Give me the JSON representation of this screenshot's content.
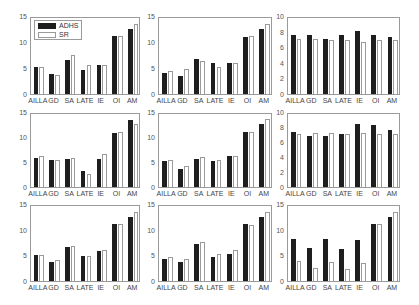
{
  "legend": {
    "items": [
      {
        "label": "ADHS",
        "color": "#1e1e1e"
      },
      {
        "label": "SR",
        "color": "#ffffff"
      }
    ]
  },
  "chart_data": [
    {
      "type": "bar",
      "panel": "row1-col1",
      "categories": [
        "AILLA",
        "GD",
        "SA",
        "LATE",
        "IE",
        "OI",
        "AM"
      ],
      "series": [
        {
          "name": "ADHS",
          "values": [
            5.4,
            4.0,
            6.7,
            4.7,
            5.8,
            11.4,
            12.9
          ]
        },
        {
          "name": "SR",
          "values": [
            5.4,
            3.8,
            7.7,
            5.7,
            5.8,
            11.4,
            13.9
          ]
        }
      ],
      "ylim": [
        0,
        15
      ],
      "yticks": [
        0,
        5,
        10,
        15
      ],
      "legend": true,
      "legend_position": "upper left"
    },
    {
      "type": "bar",
      "panel": "row1-col2",
      "categories": [
        "AILLA",
        "GD",
        "SA",
        "LATE",
        "IE",
        "OI",
        "AM"
      ],
      "series": [
        {
          "name": "ADHS",
          "values": [
            4.2,
            3.6,
            7.0,
            6.2,
            6.2,
            11.3,
            12.9
          ]
        },
        {
          "name": "SR",
          "values": [
            4.6,
            4.9,
            6.5,
            5.3,
            6.2,
            11.4,
            13.9
          ]
        }
      ],
      "ylim": [
        0,
        15
      ],
      "yticks": [
        0,
        5,
        10,
        15
      ]
    },
    {
      "type": "bar",
      "panel": "row1-col3",
      "categories": [
        "AILLA",
        "GD",
        "SA",
        "LATE",
        "IE",
        "OI",
        "AM"
      ],
      "series": [
        {
          "name": "ADHS",
          "values": [
            7.7,
            7.7,
            7.3,
            7.8,
            8.3,
            7.8,
            7.5
          ]
        },
        {
          "name": "SR",
          "values": [
            7.2,
            7.2,
            7.1,
            7.1,
            6.9,
            7.1,
            7.1
          ]
        }
      ],
      "ylim": [
        0,
        10
      ],
      "yticks": [
        0,
        2,
        4,
        6,
        8,
        10
      ]
    },
    {
      "type": "bar",
      "panel": "row2-col1",
      "categories": [
        "AILLA",
        "GD",
        "SA",
        "LATE",
        "IE",
        "OI",
        "AM"
      ],
      "series": [
        {
          "name": "ADHS",
          "values": [
            6.0,
            5.6,
            5.8,
            3.2,
            5.8,
            11.2,
            13.8
          ]
        },
        {
          "name": "SR",
          "values": [
            6.3,
            5.6,
            5.9,
            2.7,
            6.8,
            11.3,
            12.9
          ]
        }
      ],
      "ylim": [
        0,
        15
      ],
      "yticks": [
        0,
        5,
        10,
        15
      ]
    },
    {
      "type": "bar",
      "panel": "row2-col2",
      "categories": [
        "AILLA",
        "GD",
        "SA",
        "LATE",
        "IE",
        "OI",
        "AM"
      ],
      "series": [
        {
          "name": "ADHS",
          "values": [
            5.3,
            3.8,
            5.8,
            5.3,
            6.4,
            11.3,
            12.9
          ]
        },
        {
          "name": "SR",
          "values": [
            5.6,
            4.3,
            6.2,
            5.6,
            6.3,
            11.3,
            13.9
          ]
        }
      ],
      "ylim": [
        0,
        15
      ],
      "yticks": [
        0,
        5,
        10,
        15
      ]
    },
    {
      "type": "bar",
      "panel": "row2-col3",
      "categories": [
        "AILLA",
        "GD",
        "SA",
        "LATE",
        "IE",
        "OI",
        "AM"
      ],
      "series": [
        {
          "name": "ADHS",
          "values": [
            7.6,
            7.0,
            7.0,
            7.2,
            8.6,
            8.5,
            7.8
          ]
        },
        {
          "name": "SR",
          "values": [
            7.3,
            7.4,
            7.4,
            7.3,
            7.4,
            7.3,
            7.3
          ]
        }
      ],
      "ylim": [
        0,
        10
      ],
      "yticks": [
        0,
        2,
        4,
        6,
        8,
        10
      ]
    },
    {
      "type": "bar",
      "panel": "row3-col1",
      "categories": [
        "AILLA",
        "GD",
        "SA",
        "LATE",
        "IE",
        "OI",
        "AM"
      ],
      "series": [
        {
          "name": "ADHS",
          "values": [
            5.2,
            3.9,
            6.8,
            5.1,
            6.0,
            11.4,
            12.9
          ]
        },
        {
          "name": "SR",
          "values": [
            5.2,
            4.3,
            7.0,
            5.1,
            6.2,
            11.4,
            13.9
          ]
        }
      ],
      "ylim": [
        0,
        15
      ],
      "yticks": [
        0,
        5,
        10,
        15
      ]
    },
    {
      "type": "bar",
      "panel": "row3-col2",
      "categories": [
        "AILLA",
        "GD",
        "SA",
        "LATE",
        "IE",
        "OI",
        "AM"
      ],
      "series": [
        {
          "name": "ADHS",
          "values": [
            4.4,
            3.9,
            7.5,
            4.9,
            5.4,
            11.4,
            12.9
          ]
        },
        {
          "name": "SR",
          "values": [
            4.9,
            4.4,
            7.8,
            5.4,
            6.3,
            11.3,
            13.9
          ]
        }
      ],
      "ylim": [
        0,
        15
      ],
      "yticks": [
        0,
        5,
        10,
        15
      ]
    },
    {
      "type": "bar",
      "panel": "row3-col3",
      "categories": [
        "AILLA",
        "GD",
        "SA",
        "LATE",
        "IE",
        "OI",
        "AM"
      ],
      "series": [
        {
          "name": "ADHS",
          "values": [
            8.5,
            6.7,
            8.5,
            6.5,
            8.3,
            11.5,
            12.9
          ]
        },
        {
          "name": "SR",
          "values": [
            4.0,
            2.6,
            3.9,
            2.5,
            3.7,
            11.4,
            13.9
          ]
        }
      ],
      "ylim": [
        0,
        15
      ],
      "yticks": [
        0,
        5,
        10,
        15
      ]
    }
  ]
}
